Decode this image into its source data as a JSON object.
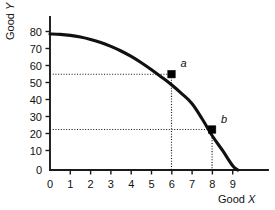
{
  "chart_data": {
    "type": "line",
    "title": "",
    "subtitle": "",
    "xlabel_prefix": "Good",
    "xlabel_var": "X",
    "ylabel_prefix": "Good",
    "ylabel_var": "Y",
    "xlim": [
      0,
      9.6
    ],
    "ylim": [
      0,
      85
    ],
    "grid": false,
    "legend": false,
    "x_ticks": [
      "0",
      "1",
      "2",
      "3",
      "4",
      "5",
      "6",
      "7",
      "8",
      "9"
    ],
    "x_tick_values": [
      0,
      1,
      2,
      3,
      4,
      5,
      6,
      7,
      8,
      9
    ],
    "y_ticks": [
      "0",
      "10",
      "20",
      "30",
      "40",
      "50",
      "60",
      "70",
      "80"
    ],
    "y_tick_values": [
      0,
      10,
      20,
      30,
      40,
      50,
      60,
      70,
      80
    ],
    "series": [
      {
        "name": "production-possibilities-frontier",
        "kind": "curve",
        "color": "#111111",
        "x": [
          0.0,
          0.5,
          1.0,
          1.5,
          2.0,
          2.5,
          3.0,
          3.5,
          4.0,
          4.5,
          5.0,
          5.5,
          6.0,
          6.5,
          7.0,
          7.5,
          8.0,
          8.5,
          9.0,
          9.25
        ],
        "y": [
          80.0,
          79.8,
          79.2,
          78.2,
          76.8,
          75.0,
          72.7,
          70.0,
          66.8,
          63.1,
          59.0,
          54.6,
          50.0,
          44.8,
          39.0,
          30.0,
          20.0,
          11.5,
          2.5,
          0.0
        ]
      }
    ],
    "points": [
      {
        "label": "a",
        "x": 6,
        "y": 50,
        "marker": "filled-square",
        "guides": [
          "horizontal",
          "vertical"
        ]
      },
      {
        "label": "b",
        "x": 8,
        "y": 20,
        "marker": "filled-square",
        "guides": [
          "horizontal",
          "vertical"
        ]
      }
    ],
    "annotations": []
  }
}
